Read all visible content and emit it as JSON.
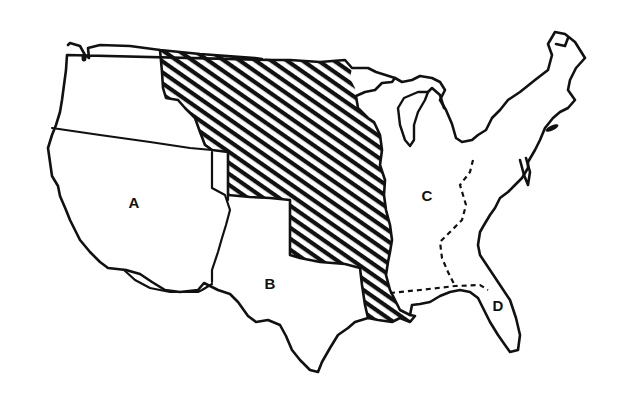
{
  "map": {
    "subject": "United States territorial acquisitions outline map",
    "background_color": "#ffffff",
    "line_color": "#111111",
    "hatched_region": {
      "label": "",
      "pattern": "curved diagonal hatching"
    },
    "regions": [
      {
        "id": "A",
        "label": "A",
        "x": 134,
        "y": 202
      },
      {
        "id": "B",
        "label": "B",
        "x": 270,
        "y": 283
      },
      {
        "id": "C",
        "label": "C",
        "x": 427,
        "y": 195
      },
      {
        "id": "D",
        "label": "D",
        "x": 498,
        "y": 305
      }
    ]
  }
}
